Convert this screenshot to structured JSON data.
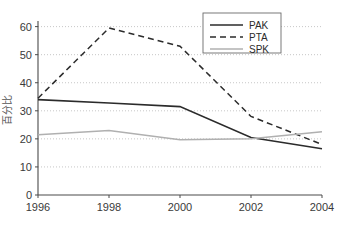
{
  "chart_data": {
    "type": "line",
    "title": "",
    "xlabel": "",
    "ylabel": "百分比",
    "x": [
      1996,
      1998,
      2000,
      2002,
      2004
    ],
    "categories": [
      "1996",
      "1998",
      "2000",
      "2002",
      "2004"
    ],
    "xlim": [
      1996,
      2004
    ],
    "ylim": [
      0,
      62
    ],
    "yticks": [
      0,
      10,
      20,
      30,
      40,
      50,
      60
    ],
    "ytick_labels": [
      "0",
      "10",
      "20",
      "30",
      "40",
      "50",
      "60"
    ],
    "xtick_labels": [
      "1996",
      "1998",
      "2000",
      "2002",
      "2004"
    ],
    "grid": true,
    "grid_axis": "y",
    "legend_position": "top-right",
    "series": [
      {
        "name": "PAK",
        "values": [
          34.0,
          32.8,
          31.5,
          20.5,
          16.5
        ],
        "style": "solid",
        "color": "#2b2b2b",
        "width": 1.6
      },
      {
        "name": "PTA",
        "values": [
          34.5,
          59.5,
          53.0,
          28.0,
          18.0
        ],
        "style": "dashed",
        "color": "#2b2b2b",
        "width": 1.5
      },
      {
        "name": "SPK",
        "values": [
          21.5,
          23.0,
          19.7,
          20.0,
          22.5
        ],
        "style": "solid",
        "color": "#b0b0b0",
        "width": 1.5
      }
    ]
  },
  "legend": {
    "entries": [
      {
        "label": "PAK"
      },
      {
        "label": "PTA"
      },
      {
        "label": "SPK"
      }
    ]
  },
  "colors": {
    "pak": "#2b2b2b",
    "pta": "#2b2b2b",
    "spk": "#b0b0b0",
    "axis": "#4a4a4a",
    "grid": "#b9b9b9",
    "background": "#ffffff"
  }
}
